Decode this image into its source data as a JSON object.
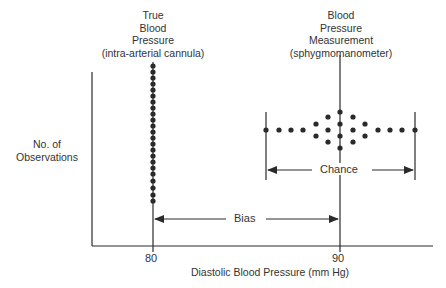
{
  "diagram": {
    "title_left": [
      "True",
      "Blood",
      "Pressure",
      "(intra-arterial cannula)"
    ],
    "title_right": [
      "Blood",
      "Pressure",
      "Measurement",
      "(sphygmomanometer)"
    ],
    "y_axis_label": [
      "No. of",
      "Observations"
    ],
    "x_axis_label": "Diastolic Blood Pressure (mm Hg)",
    "x_ticks": [
      "80",
      "90"
    ],
    "annotations": {
      "chance": "Chance",
      "bias": "Bias"
    },
    "colors": {
      "ink": "#2a2a2a",
      "background": "#ffffff"
    }
  }
}
